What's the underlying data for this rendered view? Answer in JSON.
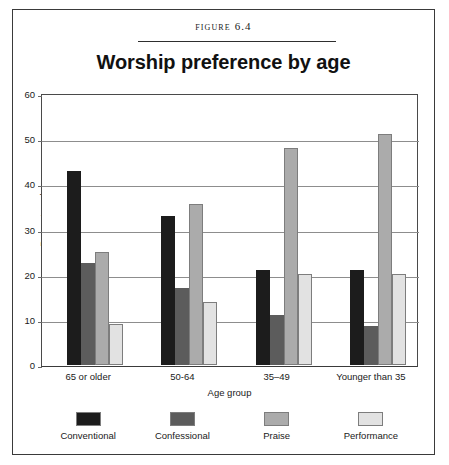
{
  "figure": {
    "caption": "Figure 6.4"
  },
  "chart_data": {
    "type": "bar",
    "title": "Worship preference by age",
    "xlabel": "Age group",
    "ylabel": "Percentage by age group",
    "ylim": [
      0,
      60
    ],
    "yticks": [
      0,
      10,
      20,
      30,
      40,
      50,
      60
    ],
    "grid": true,
    "legend_position": "bottom",
    "categories": [
      "65 or older",
      "50-64",
      "35–49",
      "Younger than 35"
    ],
    "series": [
      {
        "name": "Conventional",
        "color": "#1c1c1c",
        "values": [
          43,
          33,
          21,
          21
        ]
      },
      {
        "name": "Confessional",
        "color": "#5c5c5c",
        "values": [
          22.5,
          17,
          11,
          8.5
        ]
      },
      {
        "name": "Praise",
        "color": "#ababab",
        "values": [
          25,
          35.5,
          48,
          51
        ]
      },
      {
        "name": "Performance",
        "color": "#e2e2e2",
        "values": [
          9,
          14,
          20,
          20
        ]
      }
    ]
  }
}
